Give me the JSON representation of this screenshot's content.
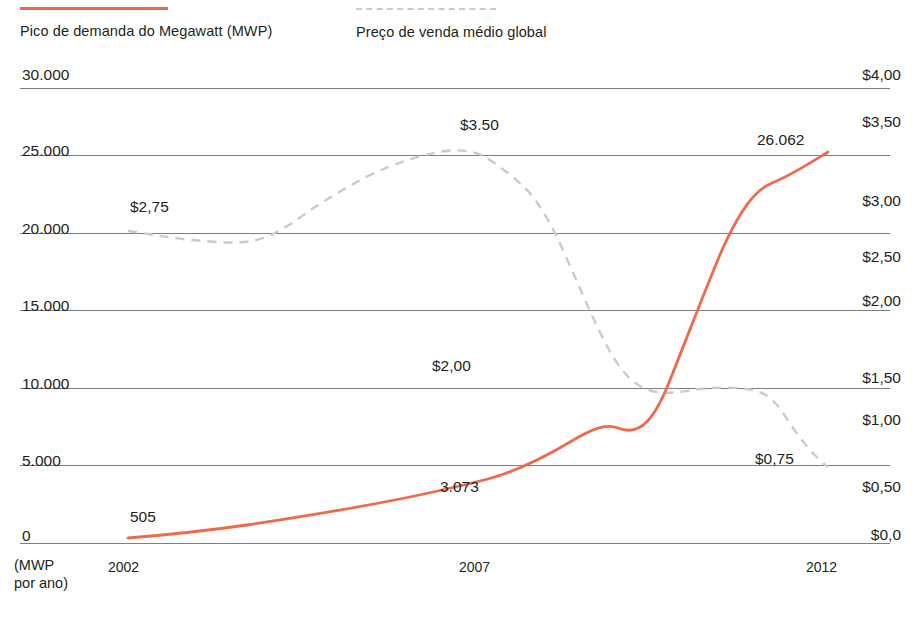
{
  "legend": {
    "items": [
      {
        "label": "Pico de demanda do Megawatt (MWP)",
        "style": "solid",
        "color": "#ED6B4A",
        "series": "mwp"
      },
      {
        "label": "Preço de venda médio global",
        "style": "dashed",
        "color": "#C9CACC",
        "series": "price"
      }
    ]
  },
  "axes": {
    "y_left": {
      "caption": "(MWP\npor ano)",
      "ticks": [
        "30.000",
        "25.000",
        "20.000",
        "15.000",
        "10.000",
        "5.000",
        "0"
      ]
    },
    "y_right": {
      "ticks": [
        "$4,00",
        "$3,50",
        "$3,00",
        "$2,50",
        "$2,00",
        "$1,50",
        "$1,00",
        "$0,50",
        "$0,0"
      ]
    },
    "x": {
      "ticks": [
        "2002",
        "2007",
        "2012"
      ]
    }
  },
  "annotations": [
    {
      "text": "$3.50",
      "x": 460,
      "y": 116,
      "series": "price"
    },
    {
      "text": "$2,75",
      "x": 130,
      "y": 198,
      "series": "price"
    },
    {
      "text": "$2,00",
      "x": 432,
      "y": 357,
      "series": "price"
    },
    {
      "text": "$0,75",
      "x": 755,
      "y": 450,
      "series": "price"
    },
    {
      "text": "26.062",
      "x": 757,
      "y": 131,
      "series": "mwp"
    },
    {
      "text": "3.073",
      "x": 440,
      "y": 478,
      "series": "mwp"
    },
    {
      "text": "505",
      "x": 130,
      "y": 508,
      "series": "mwp"
    }
  ],
  "chart_data": {
    "type": "line",
    "title": "",
    "xlabel": "(MWP por ano)",
    "ylabel": "MWP",
    "y2label": "Preço de venda médio global (US$)",
    "grid": true,
    "legend_position": "top",
    "x": [
      2002,
      2003,
      2004,
      2005,
      2006,
      2007,
      2008,
      2009,
      2010,
      2011,
      2012
    ],
    "xlim": [
      2002,
      2012
    ],
    "ylim": [
      0,
      30000
    ],
    "y2lim": [
      0,
      4.0
    ],
    "y_ticks": [
      0,
      5000,
      10000,
      15000,
      20000,
      25000,
      30000
    ],
    "y2_ticks": [
      0,
      0.5,
      1.0,
      1.5,
      2.0,
      2.5,
      3.0,
      3.5,
      4.0
    ],
    "series": [
      {
        "name": "Pico de demanda do Megawatt (MWP)",
        "axis": "left",
        "style": "solid",
        "color": "#ED6B4A",
        "values": [
          505,
          750,
          1100,
          1450,
          1950,
          2550,
          3073,
          6300,
          16500,
          22500,
          26062
        ],
        "labels": {
          "2002": "505",
          "2008": "3.073",
          "2012": "26.062"
        }
      },
      {
        "name": "Preço de venda médio global",
        "axis": "right",
        "style": "dashed",
        "color": "#C9CACC",
        "values": [
          2.75,
          2.7,
          2.85,
          3.1,
          3.32,
          3.5,
          3.45,
          3.3,
          2.05,
          1.4,
          0.75
        ],
        "labels": {
          "2002": "$2,75",
          "2007": "$3.50",
          "2010": "$2,00",
          "2012": "$0,75"
        }
      }
    ]
  },
  "geometry": {
    "gridlines_y": [
      88,
      155,
      233,
      310,
      388,
      465,
      543
    ],
    "right_gridlines_y": [
      88,
      155,
      233,
      310,
      388,
      465,
      543
    ],
    "y_left_positions": [
      78,
      148,
      225,
      302,
      380,
      457,
      533
    ],
    "y_right_positions": [
      68,
      117,
      196,
      252,
      296,
      373,
      415,
      482,
      530
    ],
    "x_positions": [
      108,
      459,
      806
    ],
    "plot_left": 20,
    "plot_right": 890,
    "mwp_path": "M 128,538 C 165,535 205,531 247,525 C 300,517 355,508 405,498 C 440,491 468,484 488,479 C 520,470 545,457 570,442 C 590,430 605,423 618,428 C 640,437 655,420 672,375 C 690,330 705,290 722,250 C 740,210 755,190 772,183 C 790,176 810,163 828,152",
    "price_path": "M 128,231 C 150,234 170,238 192,240 C 215,242 235,244 252,241 C 272,237 288,226 305,214 C 325,200 345,188 368,176 C 395,163 420,155 445,151 C 465,149 478,152 490,160 C 502,168 512,176 522,185 C 535,197 548,217 562,248 C 578,283 592,318 608,348 C 622,374 636,387 652,391 C 668,395 685,391 700,389 C 718,387 735,387 752,390 C 765,392 775,400 785,416 C 798,436 812,455 828,467"
  }
}
